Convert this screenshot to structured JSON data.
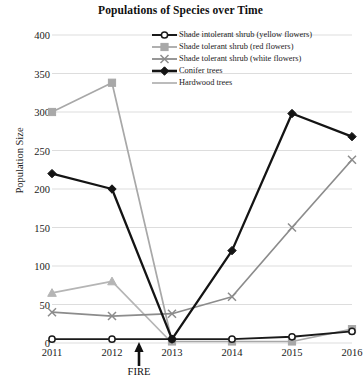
{
  "chart_data": {
    "type": "line",
    "title": "Populations of Species over Time",
    "xlabel": "",
    "ylabel": "Population Size",
    "categories": [
      "2011",
      "2012",
      "2013",
      "2014",
      "2015",
      "2016"
    ],
    "x": [
      2011,
      2012,
      2013,
      2014,
      2015,
      2016
    ],
    "ylim": [
      0,
      400
    ],
    "yticks": [
      0,
      50,
      100,
      150,
      200,
      250,
      300,
      350,
      400
    ],
    "grid": "horizontal",
    "legend_position": "top-right",
    "series": [
      {
        "name": "Shade intolerant shrub (yellow flowers)",
        "values": [
          5,
          5,
          5,
          5,
          8,
          15
        ],
        "color": "#1a1a1a",
        "marker": "circle",
        "marker_fill": "#ffffff"
      },
      {
        "name": "Shade tolerant shrub (red flowers)",
        "values": [
          300,
          338,
          2,
          2,
          2,
          18
        ],
        "color": "#a8a8a8",
        "marker": "square",
        "marker_fill": "#a8a8a8"
      },
      {
        "name": "Shade tolerant shrub (white flowers)",
        "values": [
          40,
          35,
          38,
          60,
          150,
          238
        ],
        "color": "#8c8c8c",
        "marker": "x",
        "marker_fill": "#8c8c8c"
      },
      {
        "name": "Conifer trees",
        "values": [
          220,
          200,
          5,
          120,
          298,
          268
        ],
        "color": "#141414",
        "marker": "diamond",
        "marker_fill": "#141414"
      },
      {
        "name": "Hardwood trees",
        "values": [
          65,
          80,
          0,
          0,
          0,
          0
        ],
        "color": "#b5b5b5",
        "marker": "triangle",
        "marker_fill": "#b5b5b5"
      }
    ],
    "annotations": [
      {
        "label": "FIRE",
        "x": 2012.45,
        "type": "up-arrow",
        "color": "#101010"
      }
    ]
  }
}
